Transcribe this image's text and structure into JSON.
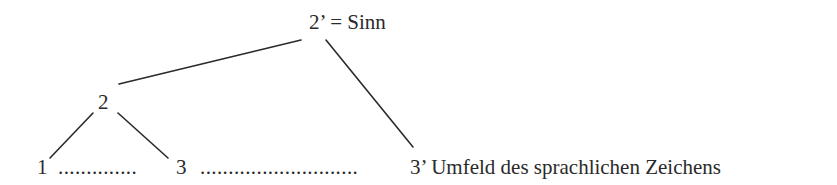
{
  "diagram": {
    "nodes": {
      "top": {
        "label": "2’ = Sinn"
      },
      "mid": {
        "label": "2"
      },
      "one": {
        "label": "1"
      },
      "three": {
        "label": "3"
      },
      "three_prime": {
        "label": "3’ Umfeld des sprachlichen Zeichens"
      }
    },
    "dots": {
      "between_1_3": "..............",
      "between_3_3prime": "............................"
    },
    "edges": [
      {
        "from": "2",
        "to": "2’"
      },
      {
        "from": "2’",
        "to": "3’"
      },
      {
        "from": "2",
        "to": "1"
      },
      {
        "from": "2",
        "to": "3"
      }
    ]
  }
}
